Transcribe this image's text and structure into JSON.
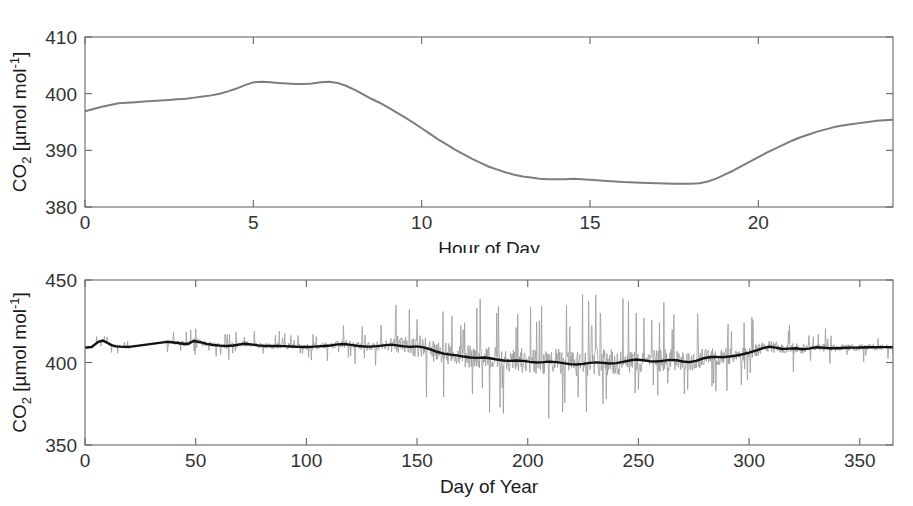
{
  "figure": {
    "name": "co2-concentration-figure",
    "panel_count": 2,
    "background_color": "#ffffff"
  },
  "chart_data": [
    {
      "id": "diurnal",
      "type": "line",
      "title": "",
      "xlabel": "Hour of Day",
      "ylabel": "CO2 [µmol mol-1]",
      "ylabel_parts": {
        "base": "CO",
        "sub": "2",
        "unit_open": " [µmol mol",
        "sup": "-1",
        "unit_close": "]"
      },
      "xlim": [
        0,
        24
      ],
      "ylim": [
        380,
        410
      ],
      "xticks": [
        0,
        5,
        10,
        15,
        20
      ],
      "yticks": [
        380,
        390,
        400,
        410
      ],
      "grid": false,
      "legend": "none",
      "series": [
        {
          "name": "Mean diurnal CO2",
          "color": "#7d7d7d",
          "x": [
            0,
            0.25,
            0.5,
            0.75,
            1,
            1.25,
            1.5,
            1.75,
            2,
            2.25,
            2.5,
            2.75,
            3,
            3.25,
            3.5,
            3.75,
            4,
            4.25,
            4.5,
            4.75,
            5,
            5.25,
            5.5,
            5.75,
            6,
            6.25,
            6.5,
            6.75,
            7,
            7.25,
            7.5,
            7.75,
            8,
            8.25,
            8.5,
            8.75,
            9,
            9.25,
            9.5,
            9.75,
            10,
            10.25,
            10.5,
            10.75,
            11,
            11.25,
            11.5,
            11.75,
            12,
            12.25,
            12.5,
            12.75,
            13,
            13.25,
            13.5,
            13.75,
            14,
            14.25,
            14.5,
            14.75,
            15,
            15.5,
            16,
            16.5,
            17,
            17.5,
            18,
            18.25,
            18.5,
            18.75,
            19,
            19.25,
            19.5,
            19.75,
            20,
            20.25,
            20.5,
            20.75,
            21,
            21.25,
            21.5,
            21.75,
            22,
            22.25,
            22.5,
            22.75,
            23,
            23.25,
            23.5,
            23.75,
            24
          ],
          "y": [
            396.9,
            397.3,
            397.7,
            398.0,
            398.3,
            398.4,
            398.5,
            398.6,
            398.7,
            398.8,
            398.9,
            399.0,
            399.1,
            399.3,
            399.5,
            399.7,
            400.0,
            400.4,
            400.9,
            401.5,
            402.0,
            402.1,
            402.0,
            401.9,
            401.8,
            401.7,
            401.7,
            401.8,
            402.0,
            402.1,
            401.9,
            401.4,
            400.7,
            399.9,
            399.1,
            398.4,
            397.6,
            396.7,
            395.8,
            394.9,
            393.9,
            392.9,
            391.9,
            391.0,
            390.1,
            389.3,
            388.5,
            387.8,
            387.1,
            386.6,
            386.1,
            385.7,
            385.4,
            385.2,
            385.0,
            384.9,
            384.9,
            384.9,
            385.0,
            384.9,
            384.8,
            384.6,
            384.4,
            384.3,
            384.2,
            384.1,
            384.1,
            384.2,
            384.5,
            385.0,
            385.7,
            386.4,
            387.2,
            388.0,
            388.8,
            389.6,
            390.3,
            391.0,
            391.7,
            392.3,
            392.8,
            393.3,
            393.7,
            394.1,
            394.4,
            394.6,
            394.8,
            395.0,
            395.2,
            395.3,
            395.4
          ]
        }
      ]
    },
    {
      "id": "annual",
      "type": "line",
      "title": "",
      "xlabel": "Day of Year",
      "ylabel": "CO2 [µmol mol-1]",
      "ylabel_parts": {
        "base": "CO",
        "sub": "2",
        "unit_open": " [µmol mol",
        "sup": "-1",
        "unit_close": "]"
      },
      "xlim": [
        0,
        365
      ],
      "ylim": [
        350,
        450
      ],
      "xticks": [
        0,
        50,
        100,
        150,
        200,
        250,
        300,
        350
      ],
      "yticks": [
        350,
        400,
        450
      ],
      "grid": false,
      "legend": "none",
      "data_gap": {
        "start_day": 20,
        "end_day": 37,
        "note": "no data between day 20 and day 37"
      },
      "series": [
        {
          "name": "Daily mean CO2 (raw)",
          "color": "#9a9a9a",
          "role": "raw",
          "noise_amplitude_by_day": [
            {
              "day": 0,
              "amp": 1.5
            },
            {
              "day": 20,
              "amp": 2.5
            },
            {
              "day": 37,
              "amp": 3.0
            },
            {
              "day": 60,
              "amp": 3.5
            },
            {
              "day": 100,
              "amp": 3.5
            },
            {
              "day": 130,
              "amp": 5.0
            },
            {
              "day": 148,
              "amp": 14.0
            },
            {
              "day": 165,
              "amp": 13.0
            },
            {
              "day": 200,
              "amp": 14.0
            },
            {
              "day": 230,
              "amp": 16.0
            },
            {
              "day": 255,
              "amp": 14.0
            },
            {
              "day": 280,
              "amp": 11.0
            },
            {
              "day": 300,
              "amp": 8.0
            },
            {
              "day": 320,
              "amp": 6.0
            },
            {
              "day": 340,
              "amp": 4.0
            },
            {
              "day": 365,
              "amp": 3.0
            }
          ]
        },
        {
          "name": "Smoothed trend CO2",
          "color": "#121212",
          "role": "smooth",
          "x": [
            0,
            3,
            6,
            8,
            10,
            12,
            14,
            16,
            18,
            20,
            37,
            39,
            42,
            45,
            47,
            49,
            52,
            55,
            58,
            61,
            64,
            67,
            70,
            72,
            75,
            78,
            81,
            84,
            87,
            90,
            93,
            96,
            99,
            102,
            105,
            108,
            111,
            114,
            117,
            120,
            123,
            126,
            129,
            132,
            135,
            138,
            141,
            144,
            147,
            150,
            153,
            156,
            159,
            162,
            165,
            168,
            171,
            174,
            177,
            180,
            183,
            186,
            189,
            192,
            195,
            198,
            201,
            204,
            207,
            210,
            213,
            216,
            219,
            222,
            225,
            228,
            231,
            234,
            237,
            240,
            243,
            246,
            249,
            252,
            255,
            258,
            261,
            264,
            267,
            270,
            273,
            276,
            279,
            282,
            285,
            288,
            291,
            294,
            297,
            300,
            303,
            306,
            309,
            312,
            315,
            318,
            321,
            324,
            327,
            330,
            333,
            336,
            339,
            342,
            345,
            348,
            351,
            354,
            357,
            360,
            363,
            365
          ],
          "y": [
            409.0,
            409.4,
            412.5,
            413.3,
            412.0,
            410.5,
            409.8,
            409.6,
            409.5,
            409.5,
            412.5,
            412.3,
            411.8,
            411.2,
            411.5,
            413.0,
            412.3,
            411.3,
            410.6,
            410.2,
            410.0,
            410.3,
            411.0,
            411.4,
            411.0,
            410.4,
            410.1,
            410.0,
            410.0,
            409.9,
            409.7,
            409.5,
            409.4,
            409.5,
            409.8,
            410.0,
            410.3,
            411.0,
            411.2,
            410.7,
            410.1,
            409.7,
            409.6,
            409.9,
            410.4,
            410.8,
            410.4,
            409.8,
            409.5,
            409.8,
            409.2,
            408.0,
            406.5,
            405.4,
            404.8,
            404.3,
            403.6,
            403.0,
            402.8,
            403.0,
            402.6,
            401.8,
            401.2,
            401.0,
            401.2,
            401.0,
            400.4,
            400.0,
            400.2,
            400.5,
            400.2,
            399.6,
            399.0,
            398.8,
            399.2,
            399.8,
            400.1,
            399.8,
            399.4,
            399.6,
            400.4,
            401.2,
            401.8,
            401.4,
            400.8,
            400.6,
            401.0,
            401.6,
            401.4,
            400.6,
            400.2,
            401.0,
            402.4,
            403.2,
            403.4,
            403.2,
            403.6,
            404.2,
            405.0,
            406.0,
            407.2,
            408.6,
            409.6,
            409.0,
            408.2,
            408.4,
            408.6,
            408.0,
            408.4,
            409.2,
            409.0,
            408.6,
            408.6,
            408.8,
            409.0,
            409.0,
            409.1,
            409.2,
            409.2,
            409.3,
            409.3,
            409.3
          ]
        }
      ]
    }
  ]
}
